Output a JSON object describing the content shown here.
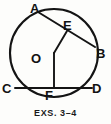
{
  "figure": {
    "caption": "EXS. 3–4",
    "ink_color": "#141414",
    "background_color": "#fdfdfb",
    "labels": {
      "A": "A",
      "B": "B",
      "C": "C",
      "D": "D",
      "E": "E",
      "F": "F",
      "O": "O"
    },
    "circle": {
      "center_x": 54,
      "center_y": 53,
      "radius": 44
    },
    "points": {
      "A": {
        "x": 38,
        "y": 12
      },
      "B": {
        "x": 95,
        "y": 47
      },
      "C": {
        "x": 15,
        "y": 88
      },
      "D": {
        "x": 92,
        "y": 88
      },
      "E": {
        "x": 67,
        "y": 31
      },
      "F": {
        "x": 54,
        "y": 88
      },
      "O": {
        "x": 54,
        "y": 53
      }
    },
    "segments": [
      {
        "name": "chord-AB",
        "from": "A",
        "to": "B"
      },
      {
        "name": "chord-CD",
        "from": "C",
        "to": "D"
      },
      {
        "name": "radius-OE",
        "from": "O",
        "to": "E"
      },
      {
        "name": "segment-OF",
        "from": "O",
        "to": "F"
      }
    ]
  }
}
